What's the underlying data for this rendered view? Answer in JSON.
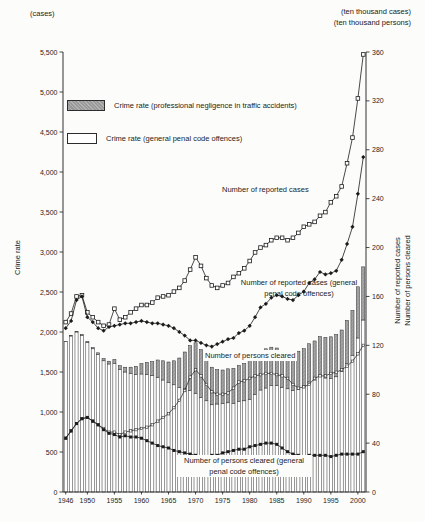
{
  "header": {
    "left_unit": "(cases)",
    "right_unit_line1": "(ten thousand cases)",
    "right_unit_line2": "(ten thousand persons)"
  },
  "legend": {
    "items": [
      {
        "swatch": "gray-hatched",
        "label": "Crime rate (professional negligence in traffic accidents)"
      },
      {
        "swatch": "white",
        "label": "Crime rate (general penal code offences)"
      }
    ]
  },
  "axes": {
    "left": {
      "title": "Crime rate",
      "tick_labels": [
        "0",
        "500",
        "1,000",
        "1,500",
        "2,000",
        "2,500",
        "3,000",
        "3,500",
        "4,000",
        "4,500",
        "5,000",
        "5,500"
      ],
      "tick_values": [
        0,
        500,
        1000,
        1500,
        2000,
        2500,
        3000,
        3500,
        4000,
        4500,
        5000,
        5500
      ],
      "range": [
        0,
        5500
      ]
    },
    "right": {
      "title_line1": "Number of reported cases",
      "title_line2": "Number of persons cleared",
      "tick_labels": [
        "0",
        "40",
        "80",
        "120",
        "160",
        "200",
        "240",
        "280",
        "320",
        "360"
      ],
      "tick_values": [
        0,
        40,
        80,
        120,
        160,
        200,
        240,
        280,
        320,
        360
      ],
      "range": [
        0,
        360
      ]
    },
    "x": {
      "tick_labels": [
        "1946",
        "1950",
        "1955",
        "1960",
        "1965",
        "1970",
        "1975",
        "1980",
        "1985",
        "1990",
        "1995",
        "2000"
      ],
      "tick_years": [
        1946,
        1950,
        1955,
        1960,
        1965,
        1970,
        1975,
        1980,
        1985,
        1990,
        1995,
        2000
      ]
    }
  },
  "annotations": {
    "reported_total": "Number of reported cases",
    "reported_general": "Number of reported cases (general penal code offences)",
    "cleared_total": "Number of persons cleared",
    "cleared_general": "Number of persons cleared (general penal code offences)"
  },
  "colors": {
    "ink": "#1c1c1c",
    "bar_outline": "#2e2e2e",
    "bar_white_fill": "#ffffff",
    "bar_gray_fill": "#a6a6a6",
    "background": "#fcfcfb"
  },
  "chart_data": {
    "type": "bar",
    "subtype": "stacked-bars-with-lines",
    "grid": false,
    "legend_position": "top-left-inside",
    "years": [
      1946,
      1947,
      1948,
      1949,
      1950,
      1951,
      1952,
      1953,
      1954,
      1955,
      1956,
      1957,
      1958,
      1959,
      1960,
      1961,
      1962,
      1963,
      1964,
      1965,
      1966,
      1967,
      1968,
      1969,
      1970,
      1971,
      1972,
      1973,
      1974,
      1975,
      1976,
      1977,
      1978,
      1979,
      1980,
      1981,
      1982,
      1983,
      1984,
      1985,
      1986,
      1987,
      1988,
      1989,
      1990,
      1991,
      1992,
      1993,
      1994,
      1995,
      1996,
      1997,
      1998,
      1999,
      2000,
      2001
    ],
    "bars": {
      "stacked": true,
      "axis": "left",
      "series": [
        {
          "name": "Crime rate (general penal code offences)",
          "style": "white",
          "values": [
            1880,
            1950,
            2000,
            1960,
            1870,
            1790,
            1720,
            1640,
            1600,
            1610,
            1530,
            1500,
            1480,
            1470,
            1475,
            1470,
            1455,
            1435,
            1400,
            1370,
            1340,
            1305,
            1290,
            1270,
            1235,
            1180,
            1140,
            1090,
            1100,
            1105,
            1115,
            1110,
            1135,
            1140,
            1160,
            1220,
            1275,
            1300,
            1330,
            1330,
            1310,
            1290,
            1270,
            1285,
            1325,
            1375,
            1400,
            1445,
            1425,
            1420,
            1440,
            1505,
            1610,
            1710,
            1925,
            2150
          ]
        },
        {
          "name": "Crime rate (professional negligence in traffic accidents)",
          "style": "gray-hatched",
          "values": [
            4,
            5,
            6,
            8,
            12,
            16,
            20,
            28,
            35,
            46,
            50,
            60,
            80,
            100,
            130,
            150,
            175,
            215,
            240,
            255,
            300,
            370,
            460,
            560,
            630,
            600,
            530,
            470,
            430,
            420,
            425,
            435,
            445,
            465,
            490,
            480,
            470,
            490,
            480,
            470,
            460,
            450,
            465,
            475,
            466,
            478,
            488,
            498,
            508,
            520,
            528,
            520,
            535,
            560,
            640,
            664
          ]
        }
      ]
    },
    "lines": [
      {
        "name": "Number of reported cases",
        "axis": "right",
        "marker": "open-square",
        "values": [
          139,
          146,
          160,
          161,
          147,
          143,
          139,
          136,
          137,
          150,
          141,
          143,
          147,
          150,
          153,
          153,
          155,
          159,
          160,
          161,
          164,
          167,
          173,
          182,
          192,
          185,
          175,
          169,
          167,
          169,
          171,
          176,
          179,
          183,
          189,
          196,
          200,
          202,
          206,
          208,
          208,
          206,
          208,
          212,
          217,
          219,
          221,
          226,
          229,
          237,
          242,
          250,
          269,
          290,
          322,
          358
        ]
      },
      {
        "name": "Number of reported cases (general penal code offences)",
        "axis": "right",
        "marker": "filled-diamond",
        "values": [
          134,
          140,
          157,
          160,
          143,
          139,
          134,
          132,
          135,
          136,
          137,
          138,
          138,
          139,
          140,
          139,
          138,
          138,
          137,
          136,
          134,
          131,
          128,
          124,
          124,
          122,
          120,
          119,
          121,
          123,
          125,
          126,
          130,
          132,
          136,
          143,
          151,
          154,
          159,
          161,
          160,
          158,
          157,
          161,
          164,
          171,
          174,
          180,
          178,
          179,
          181,
          190,
          203,
          217,
          244,
          274
        ]
      },
      {
        "name": "Number of persons cleared",
        "axis": "right",
        "marker": "small-open-square",
        "values": [
          44,
          50,
          56,
          60,
          61,
          58,
          55,
          52,
          49,
          49,
          47,
          49,
          50,
          51,
          52,
          53,
          55,
          58,
          61,
          64,
          69,
          75,
          83,
          94,
          100,
          95,
          88,
          82,
          80,
          80,
          81,
          85,
          90,
          91,
          93,
          95,
          96,
          97,
          97,
          96,
          95,
          93,
          88,
          85,
          86,
          88,
          93,
          95,
          95,
          97,
          98,
          100,
          103,
          107,
          113,
          120
        ]
      },
      {
        "name": "Number of persons cleared (general penal code offences)",
        "axis": "right",
        "marker": "filled-square",
        "values": [
          44,
          50,
          56,
          60,
          61,
          58,
          55,
          51,
          48,
          47,
          45,
          46,
          45,
          45,
          44,
          42,
          40,
          38,
          37,
          36,
          34,
          33,
          32,
          31,
          30,
          29,
          29,
          30,
          30,
          32,
          33,
          34,
          35,
          35,
          37,
          38,
          39,
          40,
          40,
          39,
          36,
          33,
          31,
          30,
          29,
          30,
          30,
          30,
          30,
          29,
          30,
          31,
          31,
          31,
          31,
          33
        ]
      }
    ],
    "left_axis_range": [
      0,
      5500
    ],
    "right_axis_range": [
      0,
      360
    ]
  }
}
